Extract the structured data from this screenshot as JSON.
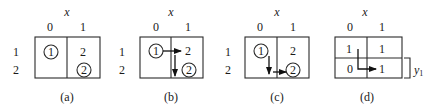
{
  "figure": {
    "axis_label": "x",
    "col_labels": [
      "0",
      "1"
    ],
    "row_labels": [
      "1",
      "2"
    ],
    "panels": [
      {
        "id": "a",
        "caption": "(a)",
        "cells": {
          "r1c0": "1",
          "r1c1": "2",
          "r2c0": "",
          "r2c1": "2"
        },
        "circled": [
          "r1c0",
          "r2c1"
        ],
        "arrows": []
      },
      {
        "id": "b",
        "caption": "(b)",
        "cells": {
          "r1c0": "1",
          "r1c1": "2",
          "r2c0": "",
          "r2c1": "2"
        },
        "circled": [
          "r1c0",
          "r2c1"
        ],
        "arrows": [
          "r1c0 → r1c1 (right)",
          "r1c1 → r2c1 (down)"
        ]
      },
      {
        "id": "c",
        "caption": "(c)",
        "cells": {
          "r1c0": "1",
          "r1c1": "2",
          "r2c0": "",
          "r2c1": "2"
        },
        "circled": [
          "r1c0",
          "r2c1"
        ],
        "arrows": [
          "r1c0 → r2c0 (down)",
          "r2c0 → r2c1 (right)"
        ]
      },
      {
        "id": "d",
        "caption": "(d)",
        "col_labels": [
          "0",
          "1"
        ],
        "cells": {
          "r1c0": "1",
          "r1c1": "1",
          "r2c0": "0",
          "r2c1": "1"
        },
        "arrows": [
          "r1c0 down then right to r2c1"
        ],
        "bracket_label": "y",
        "bracket_subscript": "1"
      }
    ]
  }
}
